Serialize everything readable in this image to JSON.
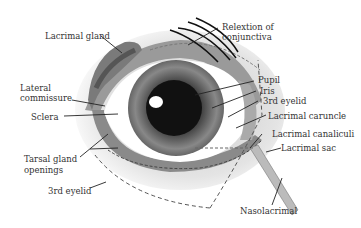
{
  "diagram": {
    "labels": {
      "lacrimal_gland": "Lacrimal gland",
      "relextion_of": "Relextion of",
      "conjunctiva": "conjunctiva",
      "lateral": "Lateral",
      "commissure": "commissure",
      "pupil": "Pupil",
      "iris": "Iris",
      "third_eyelid_top": "3rd eyelid",
      "sclera": "Sclera",
      "lacrimal_caruncle": "Lacrimal caruncle",
      "lacrimal_canaliculi": "Lacrimal canaliculi",
      "lacrimal_sac": "Lacrimal sac",
      "tarsal_gland": "Tarsal gland",
      "openings": "openings",
      "third_eyelid_bottom": "3rd eyelid",
      "nasolacrimal": "Nasolacrimal"
    },
    "colors": {
      "gland": "#777777",
      "gland_dark": "#555555",
      "lid": "#999999",
      "sclera": "#ffffff",
      "iris": "#666666",
      "pupil": "#111111",
      "duct": "#bbbbbb",
      "leader": "#222222"
    }
  }
}
